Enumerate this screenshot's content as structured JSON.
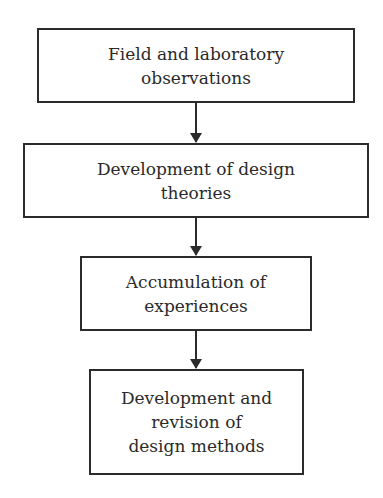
{
  "diagram": {
    "type": "flowchart",
    "direction": "top-to-bottom",
    "nodes": [
      {
        "id": "n1",
        "label": "Field and laboratory\nobservations"
      },
      {
        "id": "n2",
        "label": "Development of design\ntheories"
      },
      {
        "id": "n3",
        "label": "Accumulation of\nexperiences"
      },
      {
        "id": "n4",
        "label": "Development and\nrevision of\ndesign methods"
      }
    ],
    "edges": [
      {
        "from": "n1",
        "to": "n2"
      },
      {
        "from": "n2",
        "to": "n3"
      },
      {
        "from": "n3",
        "to": "n4"
      }
    ]
  }
}
